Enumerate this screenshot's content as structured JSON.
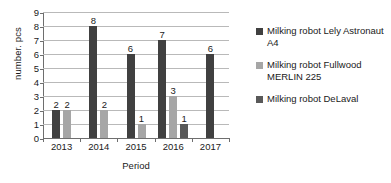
{
  "chart_data": {
    "type": "bar",
    "title": "",
    "xlabel": "Period",
    "ylabel": "number. pcs",
    "categories": [
      "2013",
      "2014",
      "2015",
      "2016",
      "2017"
    ],
    "ylim": [
      0,
      9
    ],
    "yticks": [
      "9",
      "8",
      "7",
      "6",
      "5",
      "4",
      "3",
      "2",
      "1",
      "0"
    ],
    "grid": true,
    "legend_position": "right",
    "series": [
      {
        "name": "Milking robot Lely Astronaut A4",
        "color": "#404040",
        "values": [
          2,
          8,
          6,
          7,
          6
        ],
        "labels": [
          "2",
          "8",
          "6",
          "7",
          "6"
        ]
      },
      {
        "name": "Milking robot Fullwood MERLIN 225",
        "color": "#a6a6a6",
        "values": [
          2,
          2,
          1,
          3,
          null
        ],
        "labels": [
          "2",
          "2",
          "1",
          "3",
          ""
        ]
      },
      {
        "name": "Milking robot DeLaval",
        "color": "#595959",
        "values": [
          null,
          null,
          null,
          1,
          null
        ],
        "labels": [
          "",
          "",
          "",
          "1",
          ""
        ]
      }
    ]
  },
  "legend": {
    "items": [
      {
        "label": "Milking robot Lely Astronaut A4",
        "swatch": "#404040"
      },
      {
        "label": "Milking robot Fullwood MERLIN 225",
        "swatch": "#a6a6a6"
      },
      {
        "label": "Milking robot DeLaval",
        "swatch": "#595959"
      }
    ]
  }
}
